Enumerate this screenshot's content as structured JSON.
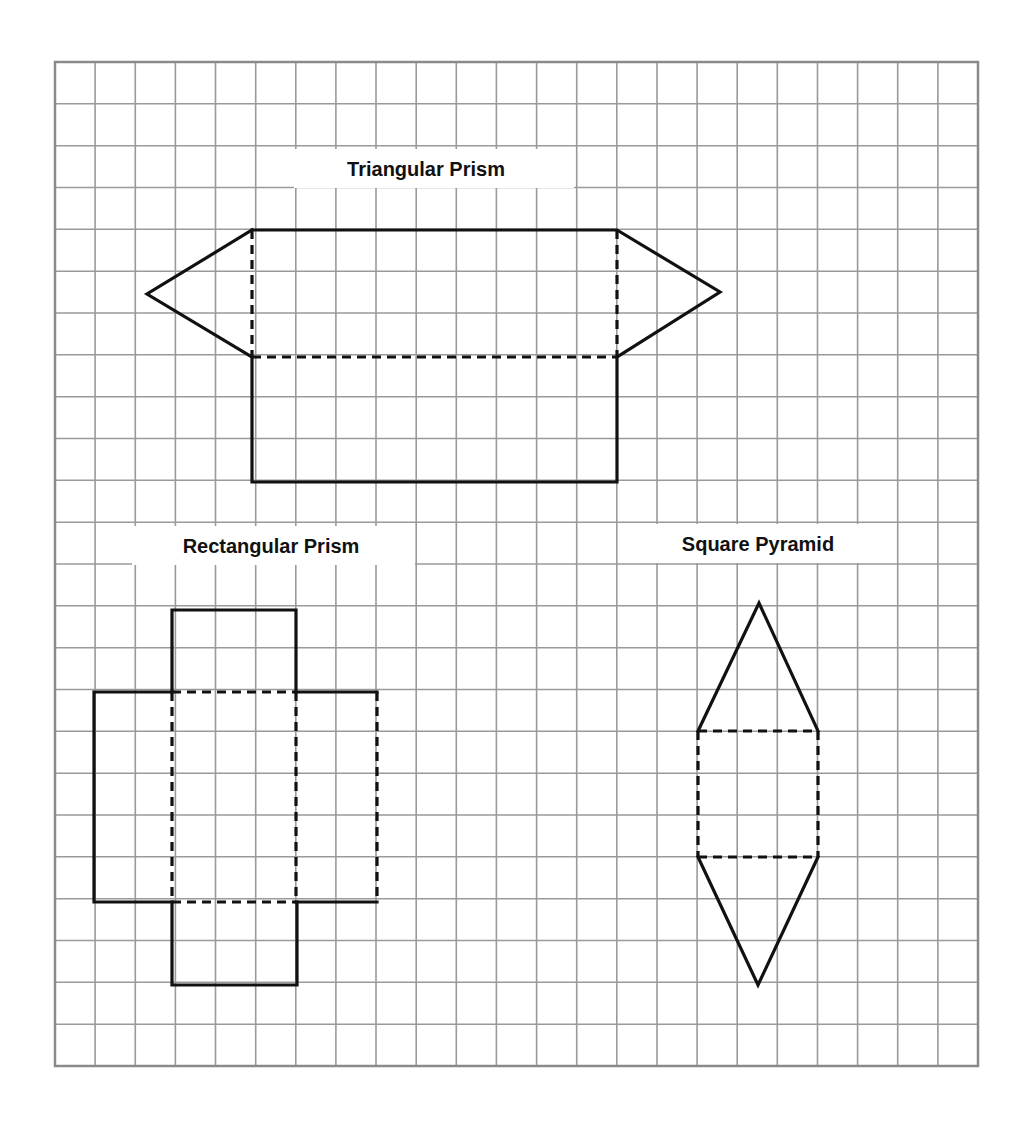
{
  "colors": {
    "background": "#ffffff",
    "grid_line": "#9a9a9a",
    "grid_border": "#8a8a8a",
    "fold_line": "#111111",
    "cut_line": "#111111",
    "label": "#111111"
  },
  "grid": {
    "left": 55,
    "top": 62,
    "right": 978,
    "bottom": 1066,
    "columns": 23,
    "rows": 24
  },
  "legend_semantics": {
    "solid": "outline (cut) edge",
    "dashed": "fold line"
  },
  "shapes": [
    {
      "id": "triangular-prism",
      "label": "Triangular Prism",
      "label_box": {
        "x": 293,
        "y": 148,
        "w": 282,
        "h": 41
      },
      "label_pos": {
        "x": 426,
        "y": 176
      },
      "solid_paths": [
        "M 252 230 L 617 230 L 720 292 L 617 357",
        "M 252 230 L 147 294 L 252 357",
        "M 252 357 L 252 482 L 617 482 L 617 357"
      ],
      "dashed_paths": [
        "M 252 230 L 252 357",
        "M 617 230 L 617 357",
        "M 252 357 L 617 357"
      ]
    },
    {
      "id": "rectangular-prism",
      "label": "Rectangular Prism",
      "label_box": {
        "x": 131,
        "y": 525,
        "w": 285,
        "h": 41
      },
      "label_pos": {
        "x": 271,
        "y": 553
      },
      "solid_paths": [
        "M 172 692 L 172 610 L 296 610 L 296 692",
        "M 172 692 L 94 692 L 94 902 L 172 902",
        "M 296 692 L 377 692",
        "M 296 902 L 377 902",
        "M 172 902 L 172 985 L 297 985 L 297 902"
      ],
      "dashed_paths": [
        "M 172 692 L 296 692",
        "M 172 692 L 172 902",
        "M 296 692 L 296 902",
        "M 172 902 L 296 902",
        "M 377 692 L 377 902"
      ]
    },
    {
      "id": "square-pyramid",
      "label": "Square Pyramid",
      "label_box": {
        "x": 618,
        "y": 523,
        "w": 279,
        "h": 41
      },
      "label_pos": {
        "x": 758,
        "y": 551
      },
      "solid_paths": [
        "M 698 731 L 759 603 L 818 731",
        "M 698 857 L 758 985 L 818 857"
      ],
      "dashed_paths": [
        "M 698 731 L 818 731",
        "M 698 857 L 818 857",
        "M 698 731 L 698 857",
        "M 818 731 L 818 857"
      ]
    }
  ]
}
